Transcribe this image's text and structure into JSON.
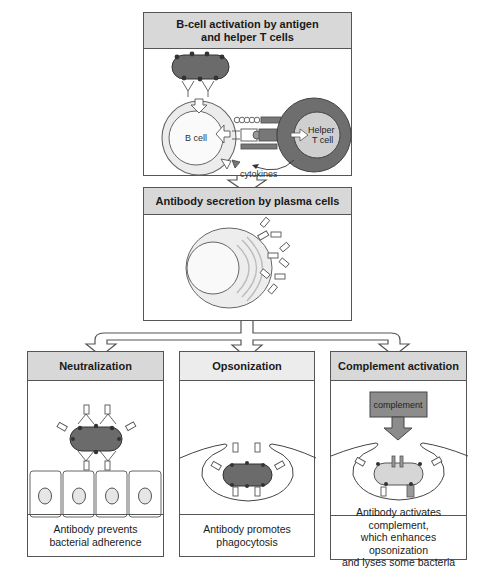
{
  "stages": {
    "activation": {
      "title_line1": "B-cell activation by antigen",
      "title_line2": "and helper T cells",
      "labels": {
        "b_cell": "B cell",
        "helper_line1": "Helper",
        "helper_line2": "T cell",
        "cytokines": "cytokines"
      }
    },
    "secretion": {
      "title": "Antibody secretion by plasma cells"
    }
  },
  "outcomes": [
    {
      "title": "Neutralization",
      "caption_lines": [
        "Antibody prevents",
        "bacterial adherence"
      ]
    },
    {
      "title": "Opsonization",
      "caption_lines": [
        "Antibody promotes",
        "phagocytosis"
      ]
    },
    {
      "title": "Complement activation",
      "caption_lines": [
        "Antibody activates complement,",
        "which enhances opsonization",
        "and lyses some bacteria"
      ],
      "inset_label": "complement"
    }
  ],
  "colors": {
    "header_fill": "#d8d8d8",
    "border": "#555555",
    "bacterium": "#6b6b6b",
    "b_cell": "#ebebeb",
    "t_cell_outer": "#6e6e6e",
    "complement_box": "#8c8c8c"
  }
}
